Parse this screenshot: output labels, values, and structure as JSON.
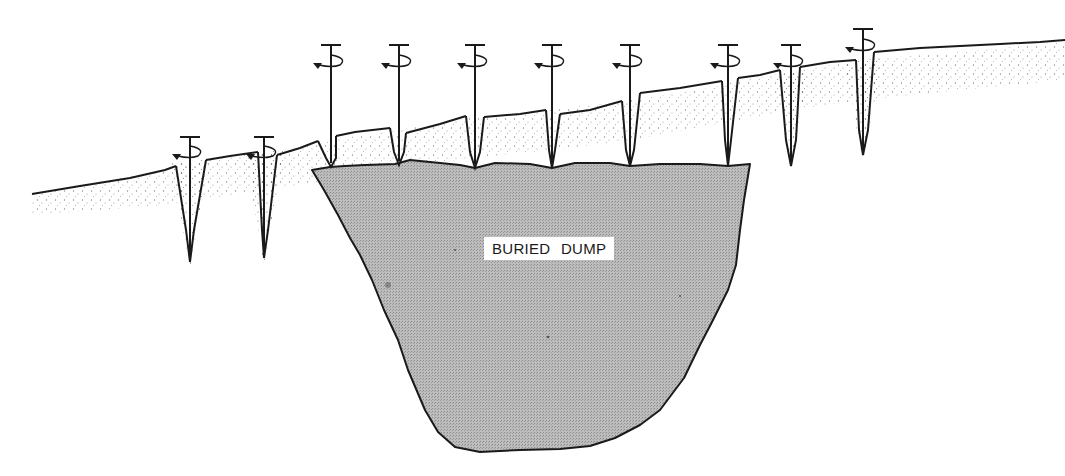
{
  "figure": {
    "type": "cross-section diagram",
    "label": "BURIED DUMP",
    "colors": {
      "background": "#ffffff",
      "ink": "#1a1a1a",
      "dump_fill": "#b4b4b4",
      "soil_stipple": "#555555"
    },
    "augers": [
      {
        "x": 190,
        "top": 136,
        "tip": 262,
        "surface": 166
      },
      {
        "x": 264,
        "top": 136,
        "tip": 258,
        "surface": 152
      },
      {
        "x": 331,
        "top": 44,
        "tip": 167,
        "surface": 140
      },
      {
        "x": 399,
        "top": 44,
        "tip": 165,
        "surface": 130
      },
      {
        "x": 475,
        "top": 44,
        "tip": 168,
        "surface": 117
      },
      {
        "x": 552,
        "top": 44,
        "tip": 168,
        "surface": 110
      },
      {
        "x": 630,
        "top": 44,
        "tip": 166,
        "surface": 100
      },
      {
        "x": 728,
        "top": 44,
        "tip": 166,
        "surface": 83
      },
      {
        "x": 791,
        "top": 44,
        "tip": 166,
        "surface": 72
      },
      {
        "x": 863,
        "top": 28,
        "tip": 155,
        "surface": 60
      }
    ]
  }
}
